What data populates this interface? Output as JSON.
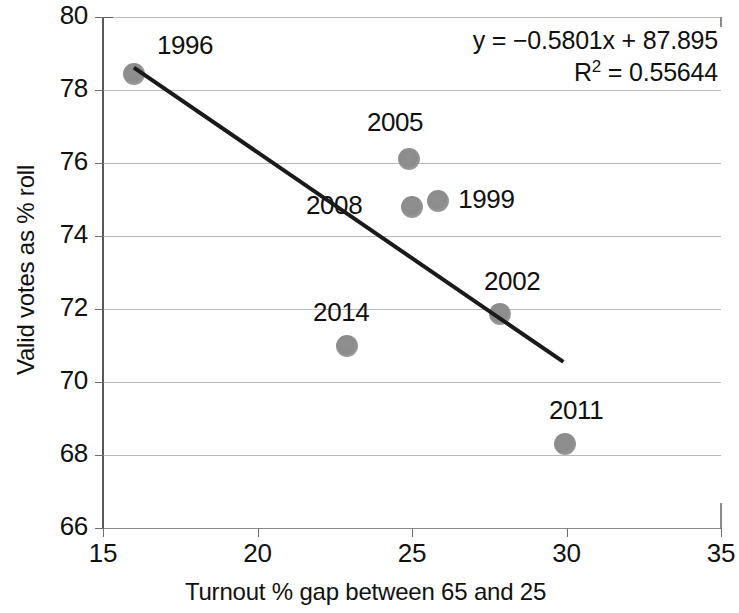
{
  "chart_data": {
    "type": "scatter",
    "title": "",
    "xlabel": "Turnout % gap between 65 and 25",
    "ylabel": "Valid votes as % roll",
    "xlim": [
      15,
      35
    ],
    "ylim": [
      66,
      80
    ],
    "xticks": [
      15,
      20,
      25,
      30,
      35
    ],
    "yticks": [
      66,
      68,
      70,
      72,
      74,
      76,
      78,
      80
    ],
    "grid": "horizontal",
    "legend": "none",
    "point_color": "#8c8c8c",
    "trendline_color": "#1a1a1a",
    "points": [
      {
        "label": "1996",
        "x": 16.0,
        "y": 78.45
      },
      {
        "label": "2005",
        "x": 24.9,
        "y": 76.1
      },
      {
        "label": "1999",
        "x": 25.85,
        "y": 74.95
      },
      {
        "label": "2008",
        "x": 25.0,
        "y": 74.8
      },
      {
        "label": "2002",
        "x": 27.85,
        "y": 71.85
      },
      {
        "label": "2014",
        "x": 22.9,
        "y": 71.0
      },
      {
        "label": "2011",
        "x": 29.95,
        "y": 68.3
      }
    ],
    "trendline": {
      "slope": -0.5801,
      "intercept": 87.895,
      "r_squared": 0.55644,
      "x_start": 16.0,
      "x_end": 29.9
    },
    "annotations": {
      "equation": "y = −0.5801x + 87.895",
      "r_squared_prefix": "R",
      "r_squared_sup": "2",
      "r_squared_value": " = 0.55644"
    }
  },
  "tick_labels": {
    "y": [
      "80",
      "78",
      "76",
      "74",
      "72",
      "70",
      "68",
      "66"
    ],
    "x": [
      "15",
      "20",
      "25",
      "30",
      "35"
    ]
  }
}
